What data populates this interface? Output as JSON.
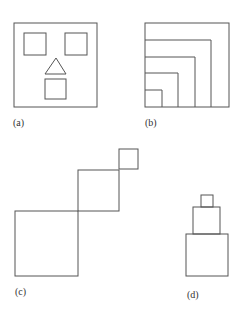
{
  "figure": {
    "stroke_color": "#555555",
    "panels": [
      {
        "id": "a",
        "label": "(a)",
        "description": "Square face with two square eyes, triangle nose and square mouth"
      },
      {
        "id": "b",
        "label": "(b)",
        "description": "Five nested squares sharing the bottom-left corner"
      },
      {
        "id": "c",
        "label": "(c)",
        "description": "Three squares of decreasing size arranged diagonally, corner to corner"
      },
      {
        "id": "d",
        "label": "(d)",
        "description": "Three stacked squares of decreasing size, centered tower"
      }
    ]
  }
}
